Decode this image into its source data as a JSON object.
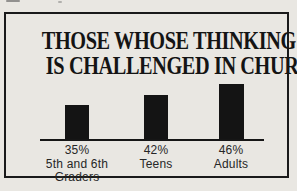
{
  "title": {
    "line1": "THOSE WHOSE THINKING",
    "line2": "IS CHALLENGED IN CHURCH"
  },
  "chart_data": {
    "type": "bar",
    "title": "THOSE WHOSE THINKING IS CHALLENGED IN CHURCH",
    "categories": [
      "5th and 6th Graders",
      "Teens",
      "Adults"
    ],
    "values": [
      35,
      42,
      46
    ],
    "value_labels": [
      "35%",
      "42%",
      "46%"
    ],
    "unit": "%",
    "xlabel": "",
    "ylabel": "",
    "grid": false,
    "legend": false,
    "bar_color": "#141414",
    "axis_color": "#161616",
    "bar_heights_px": [
      34,
      44,
      55
    ]
  },
  "columns": [
    {
      "pct": "35%",
      "line1": "5th and 6th",
      "line2": "Graders"
    },
    {
      "pct": "42%",
      "line1": "Teens",
      "line2": ""
    },
    {
      "pct": "46%",
      "line1": "Adults",
      "line2": ""
    }
  ],
  "colors": {
    "paper": "#e9e7e2",
    "frame_border": "#1a1a1a",
    "title_text": "#141414",
    "label_text": "#262626"
  }
}
